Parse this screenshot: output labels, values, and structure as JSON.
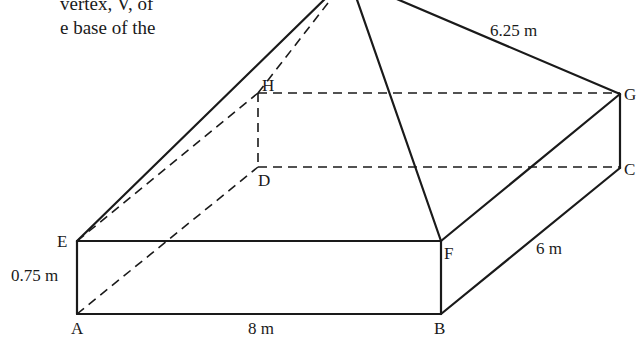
{
  "text_fragment": {
    "line1": "vertex, V, of",
    "line2": "e base of the"
  },
  "diagram": {
    "type": "rectangular prism with pyramid on top",
    "vertices": {
      "A": "A",
      "B": "B",
      "C": "C",
      "D": "D",
      "E": "E",
      "F": "F",
      "G": "G",
      "H": "H"
    },
    "dimensions": {
      "height": "0.75 m",
      "length": "8 m",
      "width": "6 m",
      "slant_edge": "6.25 m"
    },
    "line_color": "#1a1a1a"
  }
}
